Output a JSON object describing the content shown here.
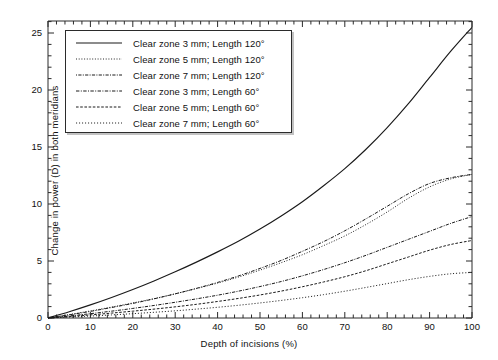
{
  "chart_data": {
    "type": "line",
    "title": "",
    "xlabel": "Depth of incisions (%)",
    "ylabel": "Change in power (D) in both meridians",
    "xlim": [
      0,
      100
    ],
    "ylim": [
      0,
      26.5
    ],
    "xticks": [
      0,
      10,
      20,
      30,
      40,
      50,
      60,
      70,
      80,
      90,
      100
    ],
    "yticks": [
      0,
      5,
      10,
      15,
      20,
      25
    ],
    "x_minor_tick_step": 2,
    "y_minor_tick_step": 1,
    "grid": false,
    "legend_position": "upper-left-inside",
    "x": [
      0,
      5,
      10,
      15,
      20,
      25,
      30,
      35,
      40,
      45,
      50,
      55,
      60,
      65,
      70,
      75,
      80,
      85,
      90,
      95,
      100
    ],
    "series": [
      {
        "name": "Clear zone 3 mm; Length 120°",
        "style": "solid",
        "values": [
          0,
          0.55,
          1.15,
          1.8,
          2.5,
          3.25,
          4.05,
          4.9,
          5.8,
          6.75,
          7.8,
          8.95,
          10.2,
          11.6,
          13.1,
          14.8,
          16.7,
          18.8,
          21.1,
          23.4,
          25.5
        ]
      },
      {
        "name": "Clear zone 5 mm; Length 120°",
        "style": "fine-dotted",
        "values": [
          0,
          0.3,
          0.62,
          0.96,
          1.32,
          1.7,
          2.12,
          2.58,
          3.06,
          3.6,
          4.2,
          4.85,
          5.55,
          6.35,
          7.2,
          8.2,
          9.3,
          10.5,
          11.5,
          12.2,
          12.6
        ]
      },
      {
        "name": "Clear zone 7 mm; Length 120°",
        "style": "dash-dot",
        "values": [
          0,
          0.18,
          0.38,
          0.6,
          0.84,
          1.1,
          1.38,
          1.68,
          2.0,
          2.36,
          2.76,
          3.2,
          3.7,
          4.25,
          4.85,
          5.5,
          6.2,
          6.9,
          7.6,
          8.3,
          8.9
        ]
      },
      {
        "name": "Clear zone 3 mm; Length 60°",
        "style": "dash-dot-dot",
        "values": [
          0,
          0.28,
          0.58,
          0.92,
          1.28,
          1.68,
          2.12,
          2.6,
          3.12,
          3.7,
          4.35,
          5.05,
          5.85,
          6.7,
          7.65,
          8.7,
          9.8,
          10.9,
          11.8,
          12.3,
          12.6
        ]
      },
      {
        "name": "Clear zone 5 mm; Length 60°",
        "style": "dashed",
        "values": [
          0,
          0.13,
          0.27,
          0.43,
          0.6,
          0.78,
          0.98,
          1.2,
          1.45,
          1.72,
          2.02,
          2.36,
          2.74,
          3.16,
          3.62,
          4.15,
          4.75,
          5.35,
          5.95,
          6.45,
          6.8
        ]
      },
      {
        "name": "Clear zone 7 mm; Length 60°",
        "style": "dotted",
        "values": [
          0,
          0.08,
          0.17,
          0.27,
          0.38,
          0.5,
          0.63,
          0.78,
          0.94,
          1.12,
          1.32,
          1.54,
          1.78,
          2.05,
          2.35,
          2.68,
          3.02,
          3.36,
          3.65,
          3.88,
          4.0
        ]
      }
    ]
  },
  "axes": {
    "x_title": "Depth of incisions (%)",
    "y_title": "Change in power (D) in both meridians",
    "x_tick_labels": [
      "0",
      "10",
      "20",
      "30",
      "40",
      "50",
      "60",
      "70",
      "80",
      "90",
      "100"
    ],
    "y_tick_labels": [
      "0",
      "5",
      "10",
      "15",
      "20",
      "25"
    ]
  },
  "legend": {
    "entries": [
      {
        "label": "Clear zone 3 mm; Length 120°",
        "style": "solid"
      },
      {
        "label": "Clear zone 5 mm; Length 120°",
        "style": "fine-dotted"
      },
      {
        "label": "Clear zone 7 mm; Length 120°",
        "style": "dash-dot"
      },
      {
        "label": "Clear zone 3 mm; Length 60°",
        "style": "dash-dot-dot"
      },
      {
        "label": "Clear zone 5 mm; Length 60°",
        "style": "dashed"
      },
      {
        "label": "Clear zone 7 mm; Length 60°",
        "style": "dotted"
      }
    ]
  },
  "colors": {
    "line": "#1a1a1a",
    "axis": "#2b2b2b",
    "background": "#ffffff"
  }
}
